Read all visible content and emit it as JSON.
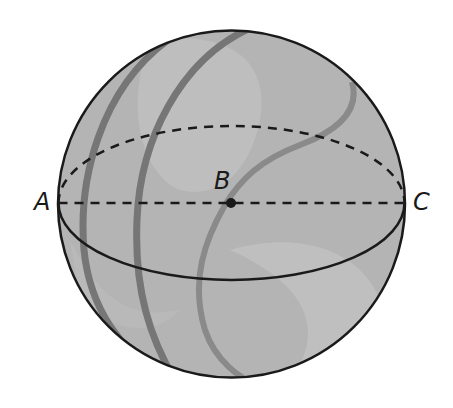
{
  "diagram": {
    "type": "sphere",
    "points": {
      "A": {
        "label": "A",
        "role": "endpoint of diameter (left)"
      },
      "B": {
        "label": "B",
        "role": "center of sphere"
      },
      "C": {
        "label": "C",
        "role": "endpoint of diameter (right)"
      }
    },
    "segments": [
      {
        "from": "A",
        "to": "C",
        "style": "dashed",
        "through": "B"
      }
    ],
    "colors": {
      "sphere_fill": "#b4b4b4",
      "highlight": "#c8c8c8",
      "stripe": "#7a7a7a",
      "stripe_light": "#8e8e8e",
      "outline": "#1a1a1a"
    }
  }
}
